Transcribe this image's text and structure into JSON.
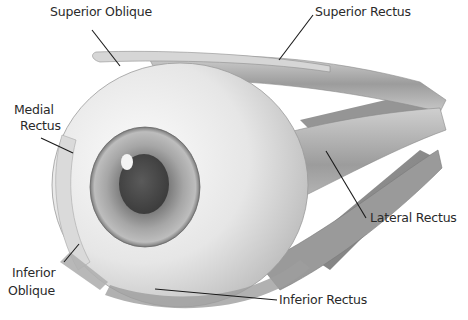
{
  "diagram": {
    "colors": {
      "background": "#ffffff",
      "sclera": "#efefef",
      "muscle": "#a9a9a9",
      "muscle_dark": "#7d7d7d",
      "iris": "#9a9a9a",
      "pupil": "#4a4a4a",
      "text": "#2a2a2a",
      "leader": "#1a1a1a"
    },
    "labels": {
      "superior_oblique": "Superior Oblique",
      "superior_rectus": "Superior Rectus",
      "medial_rectus_line1": "Medial",
      "medial_rectus_line2": "Rectus",
      "lateral_rectus": "Lateral Rectus",
      "inferior_oblique_line1": "Inferior",
      "inferior_oblique_line2": "Oblique",
      "inferior_rectus": "Inferior Rectus"
    }
  }
}
